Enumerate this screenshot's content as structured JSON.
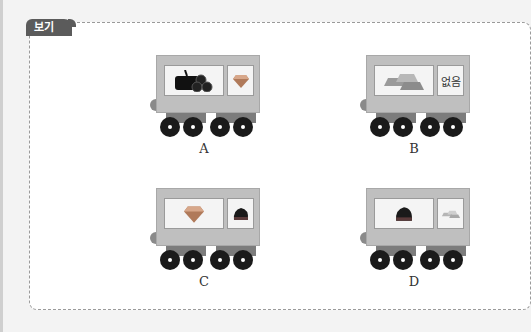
{
  "header": {
    "partial_text": "다음 중 기차 칸에 실린 물건으로 알맞은 것을 고르세요."
  },
  "box": {
    "tag_label": "보기"
  },
  "options": [
    {
      "label": "A",
      "left_item": "log-icon",
      "right_item": "diamond-icon",
      "right_text": ""
    },
    {
      "label": "B",
      "left_item": "gold-bars-icon",
      "right_item": "text",
      "right_text": "없음"
    },
    {
      "label": "C",
      "left_item": "diamond-icon",
      "right_item": "coal-icon",
      "right_text": ""
    },
    {
      "label": "D",
      "left_item": "coal-icon",
      "right_item": "gold-bars-icon",
      "right_text": ""
    }
  ]
}
